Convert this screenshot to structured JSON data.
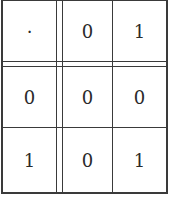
{
  "table": {
    "corner": "·",
    "column_headers": [
      "0",
      "1"
    ],
    "row_headers": [
      "0",
      "1"
    ],
    "rows": [
      {
        "header": "0",
        "cells": [
          "0",
          "0"
        ]
      },
      {
        "header": "1",
        "cells": [
          "0",
          "1"
        ]
      }
    ]
  },
  "colors": {
    "line": "#3a3a3a",
    "text": "#2a2a2a",
    "background": "#ffffff"
  }
}
